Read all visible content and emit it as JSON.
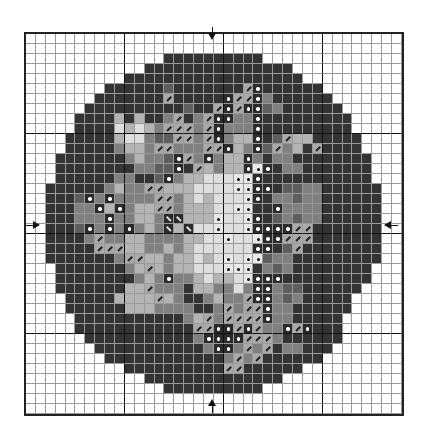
{
  "chart": {
    "type": "cross-stitch-pattern",
    "columns": 38,
    "rows": 38,
    "major_grid_every": 10,
    "center_markers": [
      "top",
      "bottom",
      "left",
      "right"
    ],
    "legend": {
      ".": {
        "name": "blank",
        "color": "#ffffff"
      },
      "D": {
        "name": "darkest background",
        "color": "#333333"
      },
      "M": {
        "name": "dark gray",
        "color": "#5e5e5e"
      },
      "G": {
        "name": "medium gray",
        "color": "#808080"
      },
      "L": {
        "name": "light gray",
        "color": "#b4b4b4"
      },
      "W": {
        "name": "very light gray",
        "color": "#dedede"
      },
      "S": {
        "name": "slash symbol",
        "color": "#aaaaaa"
      },
      "B": {
        "name": "backslash symbol",
        "color": "#2a2a2a"
      },
      "o": {
        "name": "white dot on dark",
        "color": "#2a2a2a"
      },
      "p": {
        "name": "black dot on white",
        "color": "#e8e8e8"
      }
    },
    "grid": [
      "......................................",
      "......................................",
      "..............DDDDDDDDDD..............",
      "............DDDDDDDDDDDDDDD...........",
      "..........DDDDDDDDDDDDDDDDDD..........",
      "........DDDDDDMDDDDDDDSoDDDDDD........",
      ".......DDDDDDDSDDDDDoSSoGDDDDDD.......",
      "......DDDDDDDDDDMDDSoSooMGDDDDDD......",
      ".....DDDDLDLDDGSDGSooGGoDDDDDDDDD.....",
      ".....DDDDWLWLGSSSGSoGGGoDDDDDDDDD.....",
      "....DDDDDLWWGMMSSGSoGLLoDMSLLDDDDD....",
      "....DDDDDGLLGSSGGGSSoLGoMSGLDSDDDD....",
      "...DDDDDDDGLGGMoSGoGLLoGDGGDDDDDDDD...",
      "...DDDDDDDDGGMMoDSLGLLopoDGGDDDDDDD...",
      "...DDDDDDGGDDMoGLLWWWppoDDDDDDDDDDD...",
      "..DDDDDDGLGGSSLLLWWWWppooDMMGGDDDDDD..",
      "..DDDMoGoGGGGSSGLWLWWWpoDGGMGGDDDDDD..",
      "..DDDGGoLoGLLSSGLLLWWppDDoGGGGDDDDDD..",
      "..DDDGGGoGGLLGBBLLLpWWpoDMGMGGDDDDDD..",
      "..DDDMoGoGoGLGBLBWWpWWpooooSSDDDDDDD..",
      "..DDDDGSGGLLGGGGLLWWpWWpooSSSDDDDDDD..",
      "..DDDDDSSSLLGGLGLWWWWWWooDMSDDDDDDDD..",
      "..DDDDDDDGSSLLGLLWLWpWppMGGDDDDDDDDD..",
      "...DDDDDDDGLSLGLLWWWpppDGMGDDDDDDDD...",
      "...DDDDDDDDGLGoGGLWLLWpoooDDDDDDDDD...",
      "...DDDDDDDLLSGGGDLLGGWGooGMMDDDDDD....",
      "....DDDDDLLLLSLGDDGLGGSooGMGDDDDD.....",
      "....DDDDDDLLLGGGGDDGSGSSoGGDDDDDD.....",
      ".....DDDDDDDDDDDGLSGSSSSoGGDDDDD......",
      ".....DDDDDDDDDDDDSSooSoSGGoSoDDD......",
      "......DDDDDDDDDDDGooooSSSGDDDDDD......",
      ".......DDDDDDDDDDDGooGSGSDGGDDD.......",
      "........DDDDDDDDDDDDGSGSDDDDDD........",
      "..........DDDDDDDDDDSSDDDDDD..........",
      "............DDDDDDDDDDDDDD............",
      "..............DDDDDDDDDD..............",
      "......................................",
      "......................................"
    ]
  }
}
